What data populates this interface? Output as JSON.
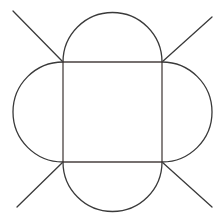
{
  "figure": {
    "type": "geometric-net-diagram",
    "canvas": {
      "width": 222,
      "height": 220
    },
    "background_color": "#ffffff",
    "stroke_color": "#3a3a3a",
    "square_edge_color": "#4a4240",
    "stroke_width": 1.3,
    "square": {
      "label": "central-square",
      "left": 63,
      "top": 62,
      "right": 162,
      "bottom": 162,
      "width": 99,
      "height": 100,
      "corners": {
        "top_left": [
          63,
          62
        ],
        "top_right": [
          162,
          62
        ],
        "bottom_right": [
          162,
          162
        ],
        "bottom_left": [
          63,
          162
        ]
      }
    },
    "arcs": [
      {
        "label": "top-flap",
        "position": "top",
        "start": [
          63,
          62
        ],
        "end": [
          162,
          62
        ],
        "radius": 49.5,
        "apex": [
          112.5,
          13
        ],
        "bulge": 49,
        "sweep": "outward-up"
      },
      {
        "label": "right-flap",
        "position": "right",
        "start": [
          162,
          62
        ],
        "end": [
          162,
          162
        ],
        "radius": 50,
        "apex": [
          211,
          112
        ],
        "bulge": 49,
        "sweep": "outward-right"
      },
      {
        "label": "bottom-flap",
        "position": "bottom",
        "start": [
          162,
          162
        ],
        "end": [
          63,
          162
        ],
        "radius": 49.5,
        "apex": [
          112.5,
          210
        ],
        "bulge": 48,
        "sweep": "outward-down"
      },
      {
        "label": "left-flap",
        "position": "left",
        "start": [
          63,
          162
        ],
        "end": [
          63,
          62
        ],
        "radius": 50,
        "apex": [
          14,
          112
        ],
        "bulge": 49,
        "sweep": "outward-left"
      }
    ],
    "diagonals": [
      {
        "label": "fold-line-top-left",
        "from": [
          63,
          62
        ],
        "to": [
          13,
          11
        ],
        "direction": "up-left",
        "angle_degrees": 225
      },
      {
        "label": "fold-line-top-right",
        "from": [
          162,
          62
        ],
        "to": [
          212,
          17
        ],
        "direction": "up-right",
        "angle_degrees": 315
      },
      {
        "label": "fold-line-bottom-left",
        "from": [
          63,
          162
        ],
        "to": [
          17,
          207
        ],
        "direction": "down-left",
        "angle_degrees": 135
      },
      {
        "label": "fold-line-bottom-right",
        "from": [
          162,
          162
        ],
        "to": [
          212,
          207
        ],
        "direction": "down-right",
        "angle_degrees": 45
      }
    ]
  },
  "chart_data": {
    "type": "diagram",
    "shapes": [
      {
        "kind": "square",
        "x": 63,
        "y": 62,
        "w": 99,
        "h": 100
      },
      {
        "kind": "semicircle",
        "edge": "top",
        "cx": 112.5,
        "cy": 62,
        "r": 49.5
      },
      {
        "kind": "semicircle",
        "edge": "right",
        "cx": 162,
        "cy": 112,
        "r": 50
      },
      {
        "kind": "semicircle",
        "edge": "bottom",
        "cx": 112.5,
        "cy": 162,
        "r": 49.5
      },
      {
        "kind": "semicircle",
        "edge": "left",
        "cx": 63,
        "cy": 112,
        "r": 50
      },
      {
        "kind": "line",
        "x1": 63,
        "y1": 62,
        "x2": 13,
        "y2": 11
      },
      {
        "kind": "line",
        "x1": 162,
        "y1": 62,
        "x2": 212,
        "y2": 17
      },
      {
        "kind": "line",
        "x1": 63,
        "y1": 162,
        "x2": 17,
        "y2": 207
      },
      {
        "kind": "line",
        "x1": 162,
        "y1": 162,
        "x2": 212,
        "y2": 207
      }
    ],
    "xlabel": "",
    "ylabel": "",
    "xlim": [
      0,
      222
    ],
    "ylim": [
      0,
      220
    ],
    "grid": false,
    "legend": null
  }
}
